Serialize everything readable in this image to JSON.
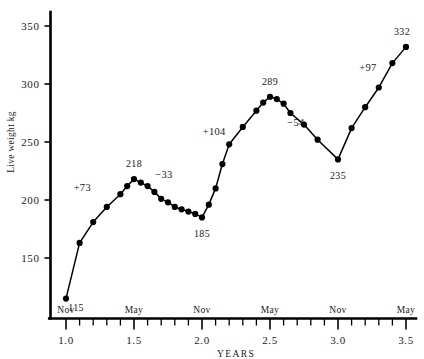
{
  "chart_data": {
    "type": "line",
    "title": "",
    "subtitle": "",
    "xlabel": "YEARS",
    "ylabel": "Live weight kg",
    "xlim": [
      0.93,
      3.58
    ],
    "ylim": [
      105,
      368
    ],
    "grid": false,
    "legend": null,
    "x_ticks_major": [
      "1.0",
      "1.5",
      "2.0",
      "2.5",
      "3.0",
      "3.5"
    ],
    "x_ticks_major_values": [
      1.0,
      1.5,
      2.0,
      2.5,
      3.0,
      3.5
    ],
    "x_minor_tick_step": 0.1,
    "y_ticks": [
      "150",
      "200",
      "250",
      "300",
      "350"
    ],
    "y_tick_values": [
      150,
      200,
      250,
      300,
      350
    ],
    "season_labels": [
      {
        "text": "Nov",
        "x": 1.0
      },
      {
        "text": "May",
        "x": 1.5
      },
      {
        "text": "Nov",
        "x": 2.0
      },
      {
        "text": "May",
        "x": 2.5
      },
      {
        "text": "Nov",
        "x": 3.0
      },
      {
        "text": "May",
        "x": 3.5
      }
    ],
    "series": [
      {
        "name": "Live weight",
        "marker": "filled-circle",
        "x": [
          1.0,
          1.1,
          1.2,
          1.3,
          1.4,
          1.45,
          1.5,
          1.55,
          1.6,
          1.65,
          1.7,
          1.75,
          1.8,
          1.85,
          1.9,
          1.95,
          2.0,
          2.05,
          2.1,
          2.15,
          2.2,
          2.3,
          2.4,
          2.45,
          2.5,
          2.55,
          2.6,
          2.65,
          2.75,
          2.85,
          3.0,
          3.1,
          3.2,
          3.3,
          3.4,
          3.5
        ],
        "values": [
          115,
          163,
          181,
          194,
          205,
          212,
          218,
          215,
          212,
          207,
          201,
          198,
          194,
          192,
          190,
          188,
          185,
          196,
          210,
          231,
          248,
          263,
          277,
          284,
          289,
          287,
          283,
          275,
          265,
          252,
          235,
          262,
          280,
          297,
          318,
          332
        ]
      }
    ],
    "point_annotations": [
      {
        "label": "115",
        "x": 1.0,
        "value": 115,
        "dx": 10,
        "dy": 12
      },
      {
        "label": "218",
        "x": 1.5,
        "value": 218,
        "dx": 0,
        "dy": -12
      },
      {
        "label": "185",
        "x": 2.0,
        "value": 185,
        "dx": 0,
        "dy": 20
      },
      {
        "label": "289",
        "x": 2.5,
        "value": 289,
        "dx": 0,
        "dy": -12
      },
      {
        "label": "235",
        "x": 3.0,
        "value": 235,
        "dx": 0,
        "dy": 20
      },
      {
        "label": "332",
        "x": 3.5,
        "value": 332,
        "dx": -4,
        "dy": -12
      }
    ],
    "gain_annotations": [
      {
        "label": "+73",
        "x": 1.12,
        "value": 208,
        "amount": 73
      },
      {
        "label": "−33",
        "x": 1.72,
        "value": 219,
        "amount": -33
      },
      {
        "label": "+104",
        "x": 2.09,
        "value": 256,
        "amount": 104
      },
      {
        "label": "−54",
        "x": 2.69,
        "value": 264,
        "amount": -54
      },
      {
        "label": "+97",
        "x": 3.22,
        "value": 311,
        "amount": 97
      }
    ]
  }
}
